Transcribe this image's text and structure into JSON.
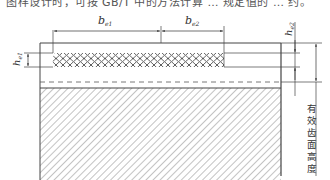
{
  "caption_fragment": "图样设计时，可按 GB/T 中的方法计算 … 规定值的 … 约。",
  "labels": {
    "be1": "b",
    "be1_sub": "e1",
    "be2": "b",
    "be2_sub": "e2",
    "he1": "h",
    "he1_sub": "e1",
    "he2": "h",
    "he2_sub": "e2",
    "effective_height": "有效齿面高度"
  },
  "colors": {
    "line": "#444444",
    "hatch": "#888888",
    "background": "#ffffff"
  }
}
